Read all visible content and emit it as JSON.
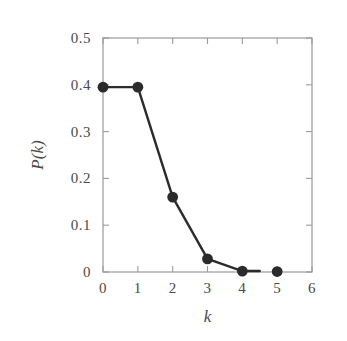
{
  "chart_data": {
    "type": "line",
    "title": "",
    "xlabel": "k",
    "ylabel": "P(k)",
    "x": [
      0,
      1,
      2,
      3,
      4,
      5
    ],
    "values": [
      0.395,
      0.395,
      0.16,
      0.028,
      0.002,
      0.001
    ],
    "series": [
      {
        "name": "P(k)",
        "x": [
          0,
          1,
          2,
          3,
          4,
          5
        ],
        "values": [
          0.395,
          0.395,
          0.16,
          0.028,
          0.002,
          0.001
        ]
      }
    ],
    "xlim": [
      0,
      6
    ],
    "ylim": [
      0,
      0.5
    ],
    "xticks": [
      0,
      1,
      2,
      3,
      4,
      5,
      6
    ],
    "yticks": [
      0,
      0.1,
      0.2,
      0.3,
      0.4,
      0.5
    ],
    "xtick_labels": [
      "0",
      "1",
      "2",
      "3",
      "4",
      "5",
      "6"
    ],
    "ytick_labels": [
      "0",
      "0.1",
      "0.2",
      "0.3",
      "0.4",
      "0.5"
    ],
    "grid": false,
    "legend": null,
    "marker": "filled-circle",
    "marker_color": "#2b2b2b",
    "line_color": "#2b2b2b",
    "axis_color": "#9a9a9a",
    "background_color": "#ffffff",
    "line_end_x": 4.5,
    "annotations": []
  }
}
